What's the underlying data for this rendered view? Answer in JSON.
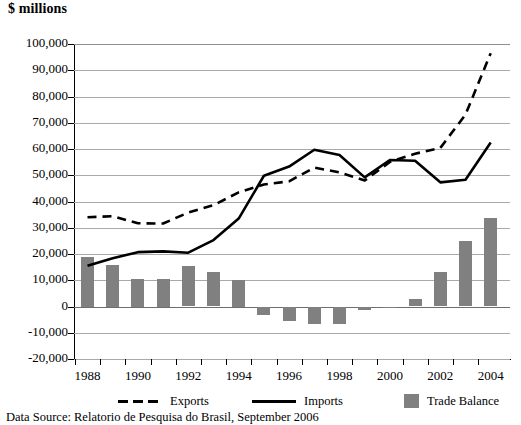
{
  "title": "$ millions",
  "source_note": "Data Source: Relatorio de Pesquisa do Brasil, September 2006",
  "colors": {
    "bar": "#808080",
    "line": "#000000",
    "gridline": "#a9a9a9",
    "background": "#ffffff"
  },
  "legend": {
    "position": "bottom",
    "items": [
      {
        "label": "Exports",
        "marker": "dashed-line-marker"
      },
      {
        "label": "Imports",
        "marker": "solid-line-marker"
      },
      {
        "label": "Trade Balance",
        "marker": "gray-square-swatch"
      }
    ]
  },
  "yaxis": {
    "labels": [
      "100,000",
      "90,000",
      "80,000",
      "70,000",
      "60,000",
      "50,000",
      "40,000",
      "30,000",
      "20,000",
      "10,000",
      "0",
      "-10,000",
      "-20,000"
    ],
    "min": -20000,
    "max": 100000,
    "step": 10000
  },
  "xaxis": {
    "labels": [
      "1988",
      "1990",
      "1992",
      "1994",
      "1996",
      "1998",
      "2000",
      "2002",
      "2004"
    ]
  },
  "chart_data": {
    "type": "line",
    "title": "$ millions",
    "xlabel": "",
    "ylabel": "$ millions",
    "ylim": [
      -20000,
      100000
    ],
    "ytick_step": 10000,
    "grid": true,
    "legend_position": "bottom",
    "x": [
      1988,
      1989,
      1990,
      1991,
      1992,
      1993,
      1994,
      1995,
      1996,
      1997,
      1998,
      1999,
      2000,
      2001,
      2002,
      2003,
      2004
    ],
    "categories": [
      "1988",
      "1989",
      "1990",
      "1991",
      "1992",
      "1993",
      "1994",
      "1995",
      "1996",
      "1997",
      "1998",
      "1999",
      "2000",
      "2001",
      "2002",
      "2003",
      "2004"
    ],
    "xtick_labels": [
      "1988",
      "1990",
      "1992",
      "1994",
      "1996",
      "1998",
      "2000",
      "2002",
      "2004"
    ],
    "series": [
      {
        "name": "Exports",
        "type": "line",
        "style": "dashed",
        "color": "#000000",
        "values": [
          34000,
          34400,
          31700,
          31600,
          35800,
          38600,
          43500,
          46500,
          47700,
          52900,
          51100,
          48000,
          55100,
          58200,
          60400,
          73100,
          96500
        ]
      },
      {
        "name": "Imports",
        "type": "line",
        "style": "solid",
        "color": "#000000",
        "values": [
          15500,
          18400,
          20700,
          21000,
          20500,
          25300,
          33500,
          49800,
          53300,
          59700,
          57700,
          49200,
          55800,
          55500,
          47300,
          48300,
          62500
        ]
      },
      {
        "name": "Trade Balance",
        "type": "bar",
        "color": "#808080",
        "values": [
          19000,
          16000,
          10500,
          10500,
          15300,
          13300,
          10000,
          -3300,
          -5600,
          -6800,
          -6600,
          -1200,
          -700,
          2700,
          13100,
          24800,
          33700
        ]
      }
    ]
  }
}
